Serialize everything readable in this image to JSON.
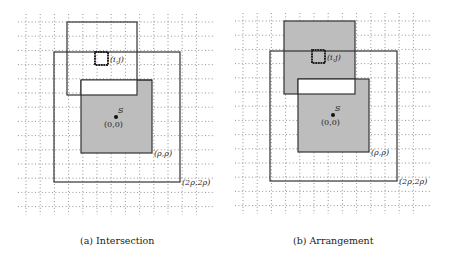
{
  "figure": {
    "panels": [
      {
        "id": "a",
        "caption": "(a) Intersection",
        "labels": {
          "cell": "(i,j)",
          "center_name": "S",
          "center_coord": "(0,0)",
          "inner_corner": "(ρ,ρ)",
          "outer_corner": "(2ρ,2ρ)"
        }
      },
      {
        "id": "b",
        "caption": "(b) Arrangement",
        "labels": {
          "cell": "(i,j)",
          "center_name": "S",
          "center_coord": "(0,0)",
          "inner_corner": "(ρ,ρ)",
          "outer_corner": "(2ρ,2ρ)"
        }
      }
    ],
    "colors": {
      "shade": "#bdbdbd",
      "stroke": "#333333",
      "grid": "#777777"
    }
  }
}
